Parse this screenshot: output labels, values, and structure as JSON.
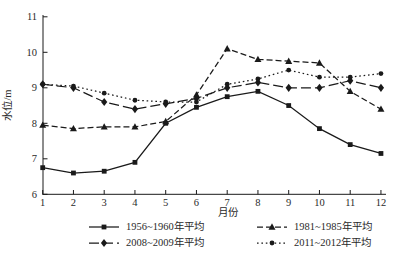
{
  "chart_data": {
    "type": "line",
    "title": "",
    "xlabel": "月份",
    "ylabel": "水位/m",
    "x": [
      1,
      2,
      3,
      4,
      5,
      6,
      7,
      8,
      9,
      10,
      11,
      12
    ],
    "xlim": [
      1,
      12
    ],
    "ylim": [
      6,
      11
    ],
    "yticks": [
      6,
      7,
      8,
      9,
      10,
      11
    ],
    "grid": false,
    "legend_position": "bottom",
    "series": [
      {
        "name": "1956~1960年平均",
        "marker": "square",
        "line": "solid",
        "values": [
          6.75,
          6.6,
          6.65,
          6.9,
          8.0,
          8.45,
          8.75,
          8.9,
          8.5,
          7.85,
          7.4,
          7.15
        ]
      },
      {
        "name": "1981~1985年平均",
        "marker": "triangle",
        "line": "dashed",
        "values": [
          7.95,
          7.85,
          7.9,
          7.9,
          8.05,
          8.8,
          10.1,
          9.8,
          9.75,
          9.7,
          8.9,
          8.4
        ]
      },
      {
        "name": "2008~2009年平均",
        "marker": "diamond",
        "line": "longdash",
        "values": [
          9.1,
          9.0,
          8.6,
          8.4,
          8.55,
          8.7,
          9.0,
          9.15,
          9.0,
          9.0,
          9.2,
          9.0
        ]
      },
      {
        "name": "2011~2012年平均",
        "marker": "circle",
        "line": "dotted",
        "values": [
          9.1,
          9.05,
          8.85,
          8.65,
          8.6,
          8.6,
          9.1,
          9.25,
          9.5,
          9.3,
          9.3,
          9.4
        ]
      }
    ]
  },
  "colors": {
    "line": "#1a1a1a",
    "text": "#2a2a2a",
    "background": "#ffffff"
  }
}
